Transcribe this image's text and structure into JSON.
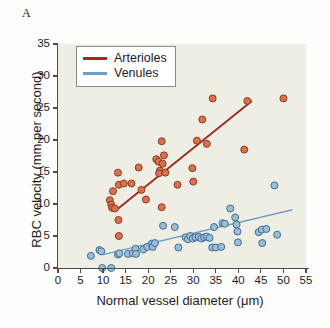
{
  "figure": {
    "panel_label": "A"
  },
  "legend": {
    "position": "top-left-inside",
    "entries": [
      {
        "label": "Arterioles",
        "color": "#9e2b21"
      },
      {
        "label": "Venules",
        "color": "#6d9fc4"
      }
    ]
  },
  "colors": {
    "arterioles_line": "#9e2b21",
    "arterioles_marker_fill": "#d9714f",
    "arterioles_marker_edge": "#8c3a22",
    "venules_line": "#6d9fc4",
    "venules_marker_fill": "#9dbcd6",
    "venules_marker_edge": "#3f6d93",
    "plot_background": "#eeeee4",
    "axis": "#4b4b4b",
    "text": "#1d1d1d"
  },
  "chart_data": {
    "type": "scatter",
    "title": "",
    "xlabel": "Normal vessel diameter (μm)",
    "ylabel": "RBC velocity (mm per second)",
    "xlim": [
      0,
      55
    ],
    "ylim": [
      0,
      35
    ],
    "xticks": [
      0,
      5,
      10,
      15,
      20,
      25,
      30,
      35,
      40,
      45,
      50,
      55
    ],
    "yticks": [
      0,
      5,
      10,
      15,
      20,
      25,
      30,
      35
    ],
    "xticklabels": [
      "0",
      "5",
      "10",
      "15",
      "20",
      "25",
      "30",
      "35",
      "40",
      "45",
      "50",
      "55"
    ],
    "yticklabels": [
      "0",
      "5",
      "10",
      "15",
      "20",
      "25",
      "30",
      "35"
    ],
    "grid": false,
    "legend_position": "upper left",
    "series": [
      {
        "name": "Arterioles",
        "marker": "circle",
        "color": "#d9714f",
        "edge_color": "#8c3a22",
        "points": [
          [
            11.5,
            10.6
          ],
          [
            11.8,
            9.9
          ],
          [
            12.0,
            9.4
          ],
          [
            12.6,
            9.3
          ],
          [
            12.2,
            12.0
          ],
          [
            13.3,
            14.9
          ],
          [
            13.5,
            13.0
          ],
          [
            14.6,
            13.2
          ],
          [
            16.3,
            13.2
          ],
          [
            13.4,
            7.5
          ],
          [
            13.5,
            5.0
          ],
          [
            17.9,
            15.7
          ],
          [
            18.5,
            12.2
          ],
          [
            19.5,
            10.7
          ],
          [
            21.8,
            17.0
          ],
          [
            22.3,
            16.6
          ],
          [
            22.6,
            15.2
          ],
          [
            22.4,
            14.8
          ],
          [
            23.2,
            16.3
          ],
          [
            23.0,
            19.8
          ],
          [
            23.5,
            17.6
          ],
          [
            23.8,
            14.9
          ],
          [
            23.0,
            9.5
          ],
          [
            26.5,
            13.0
          ],
          [
            29.8,
            15.6
          ],
          [
            30.0,
            13.5
          ],
          [
            30.8,
            19.9
          ],
          [
            32.0,
            23.2
          ],
          [
            33.0,
            19.4
          ],
          [
            34.3,
            26.5
          ],
          [
            42.0,
            26.1
          ],
          [
            41.3,
            18.5
          ],
          [
            50.0,
            26.5
          ]
        ],
        "trend_line": {
          "x": [
            12.8,
            43.0
          ],
          "y": [
            9.0,
            26.1
          ]
        }
      },
      {
        "name": "Venules",
        "marker": "circle",
        "color": "#9dbcd6",
        "edge_color": "#3f6d93",
        "points": [
          [
            7.3,
            1.9
          ],
          [
            9.2,
            2.8
          ],
          [
            9.6,
            2.6
          ],
          [
            9.8,
            0.0
          ],
          [
            11.8,
            0.0
          ],
          [
            13.3,
            2.1
          ],
          [
            13.6,
            2.3
          ],
          [
            15.5,
            2.2
          ],
          [
            16.6,
            2.3
          ],
          [
            17.2,
            3.0
          ],
          [
            17.3,
            2.2
          ],
          [
            18.9,
            2.9
          ],
          [
            19.8,
            3.3
          ],
          [
            20.8,
            3.8
          ],
          [
            21.0,
            3.3
          ],
          [
            21.5,
            3.9
          ],
          [
            23.3,
            6.6
          ],
          [
            25.9,
            6.4
          ],
          [
            26.7,
            3.2
          ],
          [
            28.3,
            4.8
          ],
          [
            28.8,
            4.5
          ],
          [
            29.3,
            5.0
          ],
          [
            29.9,
            4.6
          ],
          [
            30.5,
            4.8
          ],
          [
            31.2,
            4.9
          ],
          [
            31.8,
            4.6
          ],
          [
            32.4,
            4.8
          ],
          [
            33.0,
            4.9
          ],
          [
            33.6,
            4.7
          ],
          [
            34.2,
            3.2
          ],
          [
            35.0,
            3.2
          ],
          [
            34.6,
            6.4
          ],
          [
            36.2,
            3.3
          ],
          [
            36.5,
            7.0
          ],
          [
            37.0,
            6.9
          ],
          [
            38.2,
            9.3
          ],
          [
            39.3,
            7.9
          ],
          [
            39.6,
            6.8
          ],
          [
            39.8,
            5.7
          ],
          [
            39.9,
            4.0
          ],
          [
            44.5,
            5.6
          ],
          [
            45.2,
            6.0
          ],
          [
            45.3,
            3.9
          ],
          [
            46.2,
            6.1
          ],
          [
            48.0,
            12.9
          ],
          [
            48.6,
            5.2
          ]
        ],
        "trend_line": {
          "x": [
            10.0,
            52.0
          ],
          "y": [
            2.1,
            9.1
          ]
        }
      }
    ]
  }
}
